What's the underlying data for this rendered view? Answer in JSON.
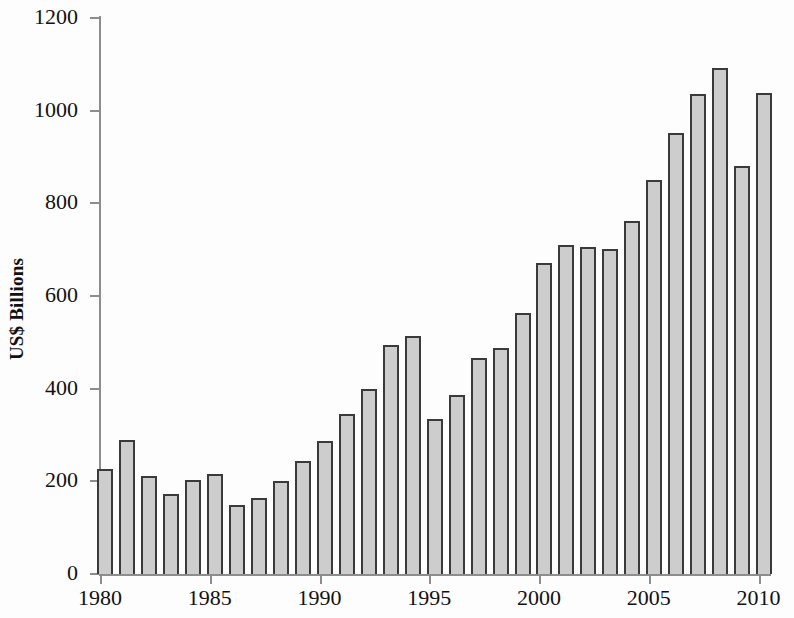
{
  "chart_data": {
    "type": "bar",
    "title": "",
    "xlabel": "",
    "ylabel": "US$ Billions",
    "ylim": [
      0,
      1200
    ],
    "xlim": [
      1979.5,
      2010.5
    ],
    "grid": false,
    "legend": null,
    "y_ticks": [
      0,
      200,
      400,
      600,
      800,
      1000,
      1200
    ],
    "y_tick_labels": [
      "0",
      "200",
      "400",
      "600",
      "800",
      "1000",
      "1200"
    ],
    "x_ticks": [
      1980,
      1985,
      1990,
      1995,
      2000,
      2005,
      2010
    ],
    "x_tick_labels": [
      "1980",
      "1985",
      "1990",
      "1995",
      "2000",
      "2005",
      "2010"
    ],
    "categories": [
      "1980",
      "1981",
      "1982",
      "1983",
      "1984",
      "1985",
      "1986",
      "1987",
      "1988",
      "1989",
      "1990",
      "1991",
      "1992",
      "1993",
      "1994",
      "1995",
      "1996",
      "1997",
      "1998",
      "1999",
      "2000",
      "2001",
      "2002",
      "2003",
      "2004",
      "2005",
      "2006",
      "2007",
      "2008",
      "2009",
      "2010"
    ],
    "values": [
      226,
      290,
      211,
      173,
      202,
      215,
      148,
      164,
      200,
      244,
      286,
      345,
      400,
      494,
      514,
      335,
      387,
      466,
      488,
      564,
      671,
      710,
      706,
      701,
      761,
      850,
      952,
      1035,
      1093,
      881,
      1039
    ],
    "bar_color": "#cdcdcd",
    "bar_edge_color": "#3a3a3a",
    "axis_color": "#8d8d8d",
    "background_color": "#fdfdfd"
  }
}
